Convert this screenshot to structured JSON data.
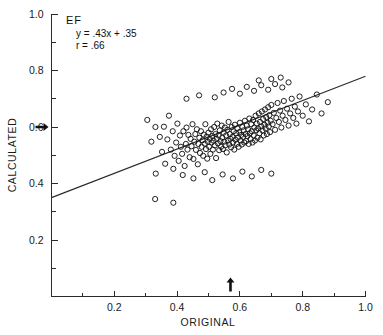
{
  "chart_data": {
    "type": "scatter",
    "title": "",
    "xlabel": "ORIGINAL",
    "ylabel": "CALCULATED",
    "xlim": [
      0.0,
      1.0
    ],
    "ylim": [
      0.0,
      1.0
    ],
    "grid": false,
    "legend": null,
    "xticks_major": [
      0.2,
      0.4,
      0.6,
      0.8,
      1.0
    ],
    "xticklabels": [
      "0.2",
      "0.4",
      "0.6",
      "0.8",
      "1.0"
    ],
    "xticks_minor": [
      0.1,
      0.3,
      0.5,
      0.7,
      0.9
    ],
    "yticks_major": [
      0.2,
      0.4,
      0.6,
      0.8,
      1.0
    ],
    "yticklabels": [
      "0.2",
      "0.4",
      "0.6",
      "0.8",
      "1.0"
    ],
    "yticks_minor": [
      0.1,
      0.3,
      0.5,
      0.7,
      0.9
    ],
    "annotations": {
      "group_label": "EF",
      "equation": "y = .43x + .35",
      "correlation": "r = .66"
    },
    "fit_line": {
      "slope": 0.43,
      "intercept": 0.35,
      "r": 0.66,
      "x_start": 0.0,
      "y_start": 0.35,
      "x_end": 1.0,
      "y_end": 0.78
    },
    "reference_markers": [
      {
        "name": "y-axis-mean-arrow",
        "axis": "y",
        "value": 0.6,
        "direction": "right"
      },
      {
        "name": "x-axis-mean-arrow",
        "axis": "x",
        "value": 0.57,
        "direction": "up"
      }
    ],
    "marker_style": {
      "shape": "open-circle",
      "radius_px": 2.6,
      "color": "#161616"
    },
    "n_points": 196,
    "points": [
      [
        0.305,
        0.625
      ],
      [
        0.318,
        0.548
      ],
      [
        0.331,
        0.6
      ],
      [
        0.345,
        0.565
      ],
      [
        0.352,
        0.512
      ],
      [
        0.358,
        0.601
      ],
      [
        0.362,
        0.47
      ],
      [
        0.369,
        0.556
      ],
      [
        0.374,
        0.64
      ],
      [
        0.38,
        0.52
      ],
      [
        0.386,
        0.585
      ],
      [
        0.392,
        0.498
      ],
      [
        0.397,
        0.545
      ],
      [
        0.401,
        0.612
      ],
      [
        0.405,
        0.48
      ],
      [
        0.409,
        0.57
      ],
      [
        0.412,
        0.53
      ],
      [
        0.416,
        0.505
      ],
      [
        0.42,
        0.585
      ],
      [
        0.424,
        0.462
      ],
      [
        0.428,
        0.54
      ],
      [
        0.43,
        0.598
      ],
      [
        0.433,
        0.52
      ],
      [
        0.436,
        0.572
      ],
      [
        0.44,
        0.493
      ],
      [
        0.443,
        0.558
      ],
      [
        0.446,
        0.532
      ],
      [
        0.449,
        0.61
      ],
      [
        0.452,
        0.487
      ],
      [
        0.455,
        0.548
      ],
      [
        0.458,
        0.575
      ],
      [
        0.46,
        0.519
      ],
      [
        0.463,
        0.592
      ],
      [
        0.466,
        0.468
      ],
      [
        0.468,
        0.54
      ],
      [
        0.471,
        0.562
      ],
      [
        0.473,
        0.508
      ],
      [
        0.476,
        0.585
      ],
      [
        0.478,
        0.53
      ],
      [
        0.481,
        0.553
      ],
      [
        0.483,
        0.498
      ],
      [
        0.485,
        0.573
      ],
      [
        0.488,
        0.541
      ],
      [
        0.49,
        0.61
      ],
      [
        0.492,
        0.522
      ],
      [
        0.494,
        0.566
      ],
      [
        0.496,
        0.488
      ],
      [
        0.498,
        0.548
      ],
      [
        0.5,
        0.58
      ],
      [
        0.502,
        0.53
      ],
      [
        0.504,
        0.558
      ],
      [
        0.506,
        0.505
      ],
      [
        0.508,
        0.592
      ],
      [
        0.51,
        0.545
      ],
      [
        0.512,
        0.568
      ],
      [
        0.514,
        0.52
      ],
      [
        0.516,
        0.552
      ],
      [
        0.518,
        0.6
      ],
      [
        0.52,
        0.535
      ],
      [
        0.522,
        0.575
      ],
      [
        0.524,
        0.49
      ],
      [
        0.526,
        0.558
      ],
      [
        0.528,
        0.612
      ],
      [
        0.53,
        0.542
      ],
      [
        0.532,
        0.57
      ],
      [
        0.534,
        0.518
      ],
      [
        0.536,
        0.588
      ],
      [
        0.538,
        0.55
      ],
      [
        0.54,
        0.53
      ],
      [
        0.542,
        0.605
      ],
      [
        0.544,
        0.562
      ],
      [
        0.546,
        0.522
      ],
      [
        0.548,
        0.58
      ],
      [
        0.55,
        0.548
      ],
      [
        0.552,
        0.598
      ],
      [
        0.554,
        0.535
      ],
      [
        0.556,
        0.57
      ],
      [
        0.558,
        0.51
      ],
      [
        0.56,
        0.59
      ],
      [
        0.562,
        0.552
      ],
      [
        0.564,
        0.618
      ],
      [
        0.566,
        0.538
      ],
      [
        0.568,
        0.575
      ],
      [
        0.57,
        0.558
      ],
      [
        0.572,
        0.528
      ],
      [
        0.574,
        0.6
      ],
      [
        0.576,
        0.565
      ],
      [
        0.578,
        0.545
      ],
      [
        0.58,
        0.585
      ],
      [
        0.582,
        0.52
      ],
      [
        0.584,
        0.608
      ],
      [
        0.586,
        0.555
      ],
      [
        0.588,
        0.578
      ],
      [
        0.59,
        0.54
      ],
      [
        0.592,
        0.595
      ],
      [
        0.594,
        0.562
      ],
      [
        0.596,
        0.53
      ],
      [
        0.598,
        0.582
      ],
      [
        0.6,
        0.615
      ],
      [
        0.602,
        0.552
      ],
      [
        0.604,
        0.572
      ],
      [
        0.606,
        0.538
      ],
      [
        0.608,
        0.6
      ],
      [
        0.61,
        0.565
      ],
      [
        0.612,
        0.588
      ],
      [
        0.614,
        0.545
      ],
      [
        0.616,
        0.622
      ],
      [
        0.618,
        0.575
      ],
      [
        0.62,
        0.55
      ],
      [
        0.622,
        0.605
      ],
      [
        0.624,
        0.568
      ],
      [
        0.626,
        0.592
      ],
      [
        0.628,
        0.54
      ],
      [
        0.63,
        0.63
      ],
      [
        0.632,
        0.578
      ],
      [
        0.634,
        0.558
      ],
      [
        0.636,
        0.61
      ],
      [
        0.638,
        0.585
      ],
      [
        0.64,
        0.545
      ],
      [
        0.642,
        0.625
      ],
      [
        0.644,
        0.57
      ],
      [
        0.646,
        0.598
      ],
      [
        0.648,
        0.552
      ],
      [
        0.65,
        0.64
      ],
      [
        0.652,
        0.588
      ],
      [
        0.654,
        0.612
      ],
      [
        0.656,
        0.562
      ],
      [
        0.658,
        0.595
      ],
      [
        0.66,
        0.648
      ],
      [
        0.662,
        0.578
      ],
      [
        0.664,
        0.618
      ],
      [
        0.666,
        0.556
      ],
      [
        0.668,
        0.602
      ],
      [
        0.67,
        0.655
      ],
      [
        0.672,
        0.588
      ],
      [
        0.674,
        0.628
      ],
      [
        0.676,
        0.57
      ],
      [
        0.678,
        0.608
      ],
      [
        0.68,
        0.662
      ],
      [
        0.682,
        0.595
      ],
      [
        0.684,
        0.635
      ],
      [
        0.686,
        0.575
      ],
      [
        0.688,
        0.615
      ],
      [
        0.69,
        0.67
      ],
      [
        0.692,
        0.602
      ],
      [
        0.694,
        0.642
      ],
      [
        0.696,
        0.582
      ],
      [
        0.698,
        0.622
      ],
      [
        0.7,
        0.678
      ],
      [
        0.704,
        0.61
      ],
      [
        0.708,
        0.65
      ],
      [
        0.712,
        0.59
      ],
      [
        0.716,
        0.632
      ],
      [
        0.72,
        0.685
      ],
      [
        0.724,
        0.618
      ],
      [
        0.728,
        0.658
      ],
      [
        0.732,
        0.598
      ],
      [
        0.736,
        0.64
      ],
      [
        0.74,
        0.692
      ],
      [
        0.745,
        0.625
      ],
      [
        0.75,
        0.665
      ],
      [
        0.755,
        0.605
      ],
      [
        0.76,
        0.648
      ],
      [
        0.765,
        0.7
      ],
      [
        0.77,
        0.632
      ],
      [
        0.775,
        0.672
      ],
      [
        0.78,
        0.612
      ],
      [
        0.785,
        0.655
      ],
      [
        0.79,
        0.708
      ],
      [
        0.8,
        0.64
      ],
      [
        0.81,
        0.68
      ],
      [
        0.82,
        0.62
      ],
      [
        0.83,
        0.662
      ],
      [
        0.845,
        0.715
      ],
      [
        0.86,
        0.648
      ],
      [
        0.88,
        0.688
      ],
      [
        0.43,
        0.7
      ],
      [
        0.47,
        0.712
      ],
      [
        0.52,
        0.705
      ],
      [
        0.548,
        0.722
      ],
      [
        0.575,
        0.735
      ],
      [
        0.6,
        0.718
      ],
      [
        0.622,
        0.742
      ],
      [
        0.645,
        0.728
      ],
      [
        0.668,
        0.748
      ],
      [
        0.69,
        0.732
      ],
      [
        0.712,
        0.752
      ],
      [
        0.735,
        0.74
      ],
      [
        0.755,
        0.758
      ],
      [
        0.66,
        0.765
      ],
      [
        0.7,
        0.77
      ],
      [
        0.73,
        0.775
      ],
      [
        0.332,
        0.435
      ],
      [
        0.388,
        0.452
      ],
      [
        0.418,
        0.43
      ],
      [
        0.452,
        0.418
      ],
      [
        0.488,
        0.44
      ],
      [
        0.512,
        0.412
      ],
      [
        0.545,
        0.432
      ],
      [
        0.578,
        0.418
      ],
      [
        0.608,
        0.442
      ],
      [
        0.638,
        0.425
      ],
      [
        0.668,
        0.448
      ],
      [
        0.7,
        0.435
      ],
      [
        0.33,
        0.345
      ],
      [
        0.388,
        0.332
      ]
    ]
  },
  "figure": {
    "axis_spines": [
      "left",
      "bottom"
    ],
    "background_color": "#ffffff",
    "foreground_color": "#1a1a1a"
  }
}
